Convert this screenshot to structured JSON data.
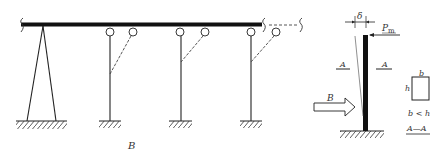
{
  "left_figure": {
    "caption": "B",
    "elements": [
      "continuous-beam",
      "a-frame-support",
      "column-1",
      "column-2",
      "column-3",
      "hinge-circles",
      "dashed-bracing",
      "fixed-supports"
    ]
  },
  "right_figure": {
    "deflection_label": "δ",
    "load_label": "P",
    "load_subscript": "m",
    "section_mark_left": "A",
    "section_mark_right": "A",
    "lateral_load_label": "B"
  },
  "section": {
    "width_label": "b",
    "height_label": "h",
    "condition": "b < h",
    "title": "A—A"
  },
  "colors": {
    "ink": "#222222",
    "background": "#ffffff"
  }
}
